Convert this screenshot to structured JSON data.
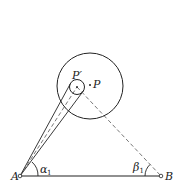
{
  "diagram": {
    "points": {
      "A": {
        "label": "A",
        "x": 20,
        "y": 176
      },
      "B": {
        "label": "B",
        "x": 161,
        "y": 176
      },
      "P": {
        "label": "P",
        "x": 90,
        "y": 85
      },
      "P_prime": {
        "label": "P′",
        "x": 77,
        "y": 87
      }
    },
    "circles": {
      "large": {
        "cx": 90,
        "cy": 86,
        "r": 33
      },
      "small": {
        "cx": 77,
        "cy": 87,
        "r": 7.5
      }
    },
    "angles": {
      "alpha": {
        "symbol": "α",
        "subscript": "1"
      },
      "beta": {
        "symbol": "β",
        "subscript": "1"
      }
    },
    "colors": {
      "stroke": "#222222",
      "dashed": "#555555",
      "background": "#ffffff"
    }
  }
}
